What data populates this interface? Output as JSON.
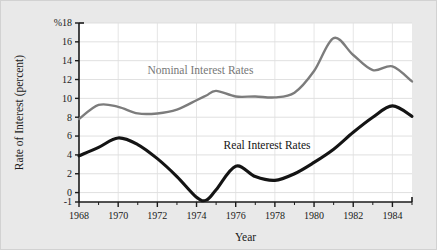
{
  "figure": {
    "background_color": "#e9e9e9",
    "plot_background_color": "#ffffff"
  },
  "chart_data": {
    "type": "line",
    "title": "",
    "xlabel": "Year",
    "ylabel": "Rate of Interest (percent)",
    "xlim": [
      1968,
      1985
    ],
    "ylim": [
      -1,
      18
    ],
    "grid": true,
    "grid_axis": "y",
    "legend_position": "inline-annotation",
    "xticks": [
      1968,
      1970,
      1972,
      1974,
      1976,
      1978,
      1980,
      1982,
      1984
    ],
    "xtick_labels": [
      "1968",
      "1970",
      "1972",
      "1974",
      "1976",
      "1978",
      "1980",
      "1982",
      "1984"
    ],
    "yticks": [
      -1,
      0,
      2,
      4,
      6,
      8,
      10,
      12,
      14,
      16,
      18
    ],
    "ytick_labels": [
      "-1",
      "0",
      "2",
      "4",
      "6",
      "8",
      "10",
      "12",
      "14",
      "16",
      "%18"
    ],
    "x": [
      1968,
      1969,
      1970,
      1971,
      1972,
      1973,
      1974,
      1974.5,
      1975,
      1976,
      1977,
      1978,
      1979,
      1980,
      1981,
      1982,
      1983,
      1984,
      1985
    ],
    "series": [
      {
        "name": "Nominal Interest Rates",
        "color": "#7c7c7c",
        "line_width": 2.4,
        "values": [
          7.8,
          9.3,
          9.1,
          8.4,
          8.4,
          8.8,
          9.8,
          10.3,
          10.8,
          10.2,
          10.2,
          10.1,
          10.6,
          12.9,
          16.4,
          14.6,
          13.0,
          13.4,
          11.8
        ]
      },
      {
        "name": "Real Interest Rates",
        "color": "#141414",
        "line_width": 3.1,
        "values": [
          3.9,
          4.8,
          5.8,
          5.1,
          3.6,
          1.7,
          -0.5,
          -0.8,
          0.3,
          2.8,
          1.7,
          1.3,
          2.0,
          3.2,
          4.6,
          6.4,
          8.0,
          9.2,
          8.1
        ]
      }
    ],
    "annotations": [
      {
        "text": "Nominal Interest Rates",
        "x": 1974.2,
        "y": 12.6,
        "color": "#777777"
      },
      {
        "text": "Real Interest Rates",
        "x": 1977.6,
        "y": 4.6,
        "color": "#141414"
      }
    ]
  }
}
